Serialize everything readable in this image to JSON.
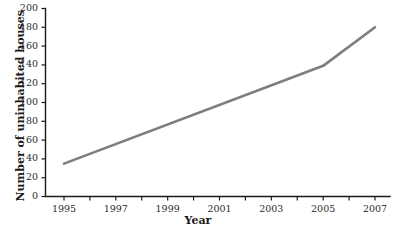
{
  "chart_data": {
    "type": "line",
    "title": "",
    "xlabel": "Year",
    "ylabel": "Number of uninhabited houses",
    "x": [
      1995,
      2005,
      2007
    ],
    "values": [
      35,
      139,
      180
    ],
    "series": [
      {
        "name": "Number of uninhabited houses",
        "x": [
          1995,
          2005,
          2007
        ],
        "values": [
          35,
          139,
          180
        ]
      }
    ],
    "xlim": [
      1994,
      2008
    ],
    "ylim": [
      0,
      200
    ],
    "y_ticks": [
      0,
      20,
      40,
      60,
      80,
      100,
      120,
      140,
      160,
      180,
      200
    ],
    "y_tick_labels": [
      "0",
      "20",
      "40",
      "60",
      "80",
      "100",
      "120",
      "140",
      "160",
      "180",
      "200"
    ],
    "x_ticks": [
      1994,
      1995,
      1996,
      1997,
      1998,
      1999,
      2000,
      2001,
      2002,
      2003,
      2004,
      2005,
      2006,
      2007,
      2008
    ],
    "x_tick_labels": [
      "1995",
      "1997",
      "1999",
      "2001",
      "2003",
      "2005",
      "2007"
    ],
    "x_labeled_ticks": [
      1995,
      1997,
      1999,
      2001,
      2003,
      2005,
      2007
    ],
    "grid": false,
    "legend": "none",
    "line_color": "#7d7d7d",
    "axis_color": "#1a1a1a"
  },
  "axes": {
    "y_title": "Number of uninhabited houses",
    "x_title": "Year"
  }
}
